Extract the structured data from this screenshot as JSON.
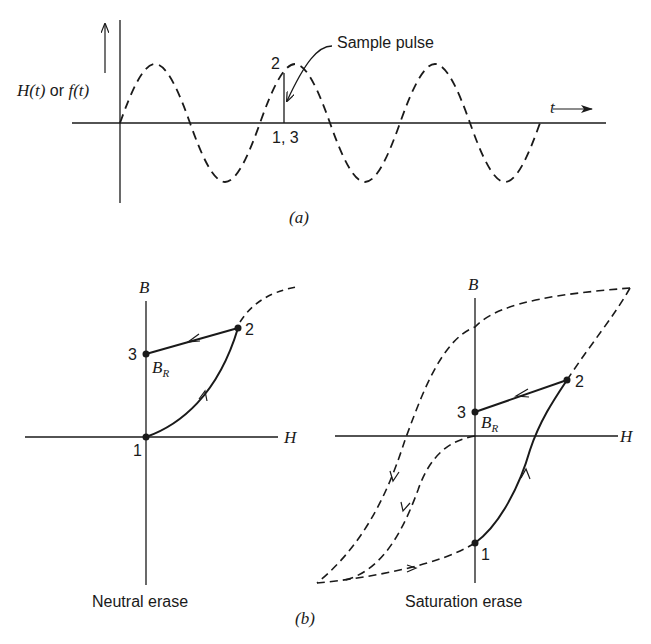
{
  "panel_a": {
    "caption": "(a)",
    "y_axis_label_H": "H(t)",
    "y_axis_label_or": " or ",
    "y_axis_label_f": "f(t)",
    "x_axis_label": "t",
    "point_2_label": "2",
    "points_1_3_label": "1, 3",
    "sample_pulse_label": "Sample pulse",
    "waveform": "dashed sine, 3 periods"
  },
  "panel_b": {
    "caption": "(b)",
    "left": {
      "title": "Neutral erase",
      "y_axis_label": "B",
      "x_axis_label": "H",
      "remanence_label": "B",
      "remanence_sub": "R",
      "point_1": "1",
      "point_2": "2",
      "point_3": "3"
    },
    "right": {
      "title": "Saturation erase",
      "y_axis_label": "B",
      "x_axis_label": "H",
      "remanence_label": "B",
      "remanence_sub": "R",
      "point_1": "1",
      "point_2": "2",
      "point_3": "3"
    }
  },
  "colors": {
    "ink": "#1a1a1a",
    "background": "#ffffff"
  }
}
